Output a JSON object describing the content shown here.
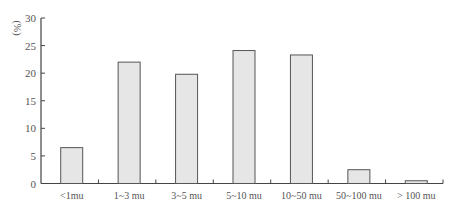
{
  "chart_data": {
    "type": "bar",
    "title": "",
    "xlabel": "",
    "ylabel": "(%)",
    "ylim": [
      0,
      30
    ],
    "yticks": [
      0,
      5,
      10,
      15,
      20,
      25,
      30
    ],
    "grid": false,
    "legend": null,
    "categories": [
      "<1mu",
      "1~3 mu",
      "3~5 mu",
      "5~10 mu",
      "10~50 mu",
      "50~100 mu",
      "> 100 mu"
    ],
    "values": [
      6.5,
      22.0,
      19.8,
      24.1,
      23.3,
      2.5,
      0.5
    ]
  },
  "style": {
    "bar_fill": "#e6e6e6",
    "bar_stroke": "#555555",
    "axis_color": "#444444",
    "text_color": "#555555"
  }
}
